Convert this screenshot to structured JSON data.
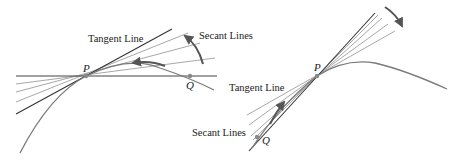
{
  "figure": {
    "left_panel": {
      "labels": {
        "tangent": "Tangent Line",
        "secant": "Secant Lines",
        "point_p": "P",
        "point_q": "Q"
      },
      "description": "Secant lines through P and Q rotate toward the tangent line at P as Q moves along the curve toward P"
    },
    "right_panel": {
      "labels": {
        "tangent": "Tangent Line",
        "secant": "Secant Lines",
        "point_p": "P",
        "point_q": "Q"
      },
      "description": "Secant lines through Q (below-left of P) and P approach the tangent line at P as Q moves toward P"
    },
    "colors": {
      "curve": "#7a7a7a",
      "tangent": "#333333",
      "secant": "#a8a8a8",
      "arrow": "#555555",
      "text": "#222222"
    }
  }
}
